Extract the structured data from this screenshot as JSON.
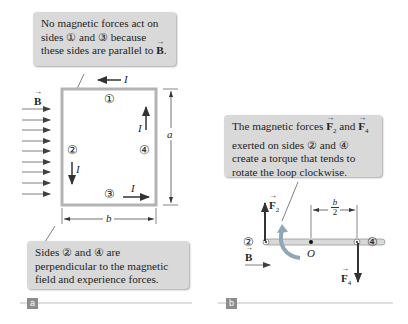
{
  "panel_a": {
    "callout_top": {
      "line1": "No magnetic forces act on",
      "line2_pre": "sides ",
      "line2_c1": "①",
      "line2_mid": " and ",
      "line2_c3": "③",
      "line2_post": " because",
      "line3_pre": "these sides are parallel to ",
      "line3_B": "B",
      "line3_post": "."
    },
    "callout_bottom": {
      "line1_pre": "Sides ",
      "line1_c2": "②",
      "line1_mid": " and ",
      "line1_c4": "④",
      "line1_post": " are",
      "line2": "perpendicular to the magnetic",
      "line3": "field and experience forces."
    },
    "field_label": "B",
    "current_label": "I",
    "side_labels": [
      "①",
      "②",
      "③",
      "④"
    ],
    "dim_a": "a",
    "dim_b": "b",
    "tag": "a"
  },
  "panel_b": {
    "callout": {
      "line1_pre": "The magnetic forces ",
      "line1_F2": "F",
      "line1_F2_sub": "2",
      "line1_mid": " and ",
      "line1_F4": "F",
      "line1_F4_sub": "4",
      "line2_pre": "exerted on sides ",
      "line2_c2": "②",
      "line2_mid": " and ",
      "line2_c4": "④",
      "line3": "create a torque that tends to",
      "line4": "rotate the loop clockwise."
    },
    "force2_label": "F",
    "force2_sub": "2",
    "force4_label": "F",
    "force4_sub": "4",
    "side_left": "②",
    "side_right": "④",
    "pivot_label": "O",
    "field_label": "B",
    "half_b_num": "b",
    "half_b_den": "2",
    "tag": "b"
  },
  "colors": {
    "callout_bg": "#d9d9d9",
    "arrow": "#404040",
    "loop_frame": "#b3b3b3",
    "tag_bg": "#8c8c8c"
  }
}
